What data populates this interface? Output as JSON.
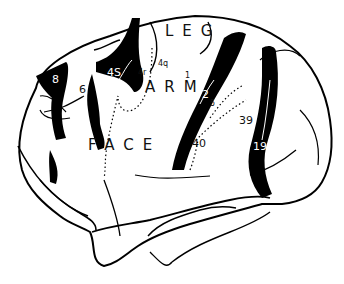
{
  "diagram": {
    "colors": {
      "outline": "#000000",
      "fill": "#ffffff",
      "band": "#000000"
    },
    "region_labels": {
      "leg": "LEG",
      "arm": "ARM",
      "face": "FACE"
    },
    "area_labels": {
      "a8": "8",
      "a6": "6",
      "a4s": "4S",
      "a4r": "4r",
      "a4q": "4q",
      "a1": "1",
      "a2": "2",
      "a5": "5",
      "a39": "39",
      "a40": "40",
      "a19": "19"
    }
  }
}
